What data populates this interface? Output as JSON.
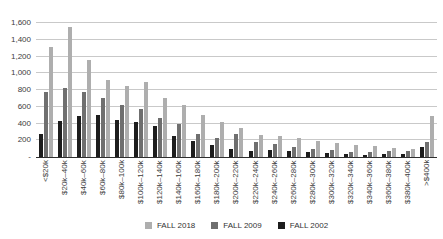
{
  "chart_data": {
    "type": "bar",
    "title": "",
    "categories": [
      "<$20k",
      "$20k–40k",
      "$40k–60k",
      "$60k–80k",
      "$80k–100k",
      "$100k–120k",
      "$120k–140k",
      "$140k–160k",
      "$160k–180k",
      "$180k–200k",
      "$200k–220k",
      "$220k–240k",
      "$240k–260k",
      "$260k–280k",
      "$280k–300k",
      "$300k–320k",
      "$320k–340k",
      "$340k–360k",
      "$360k–380k",
      "$380k–400k",
      ">$400k"
    ],
    "series": [
      {
        "name": "FALL 2018",
        "color": "#aeaeae",
        "values": [
          1310,
          1550,
          1160,
          920,
          850,
          890,
          710,
          620,
          500,
          420,
          350,
          260,
          250,
          230,
          190,
          170,
          140,
          130,
          110,
          100,
          490
        ]
      },
      {
        "name": "FALL 2009",
        "color": "#6f6f6f",
        "values": [
          780,
          820,
          780,
          700,
          620,
          570,
          470,
          390,
          280,
          230,
          270,
          180,
          150,
          120,
          100,
          85,
          65,
          65,
          75,
          70,
          180
        ]
      },
      {
        "name": "FALL 2002",
        "color": "#1d1d1d",
        "values": [
          280,
          430,
          490,
          500,
          440,
          420,
          370,
          250,
          190,
          140,
          100,
          70,
          80,
          75,
          55,
          45,
          35,
          25,
          35,
          30,
          125
        ]
      }
    ],
    "group_order": [
      2,
      1,
      0
    ],
    "y_axis": {
      "min": 0,
      "max": 1600,
      "tick_step": 200,
      "tick_labels": [
        "1,600",
        "1,400",
        "1,200",
        "1,000",
        "800",
        "600",
        "400",
        "200"
      ],
      "zero_label": "-"
    },
    "x_axis": {
      "label_rotation": "vertical-bottom-to-top"
    },
    "legend": {
      "position": "bottom-center",
      "entries": [
        "FALL 2018",
        "FALL 2009",
        "FALL 2002"
      ]
    },
    "grid": true,
    "colors": {
      "gridline": "#c9c9c9",
      "axis_line": "#2e2e2e",
      "tick_text": "#3d3d3d",
      "background": "#ffffff"
    }
  }
}
